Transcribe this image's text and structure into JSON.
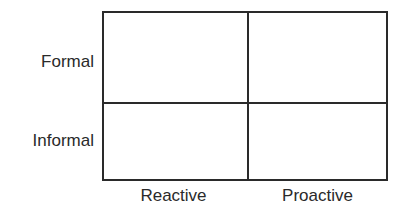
{
  "diagram": {
    "type": "2x2 matrix",
    "rows": [
      {
        "label": "Formal"
      },
      {
        "label": "Informal"
      }
    ],
    "columns": [
      {
        "label": "Reactive"
      },
      {
        "label": "Proactive"
      }
    ],
    "cells": [
      [
        "",
        ""
      ],
      [
        "",
        ""
      ]
    ],
    "line_color": "#2a2a2a",
    "background": "#ffffff"
  }
}
